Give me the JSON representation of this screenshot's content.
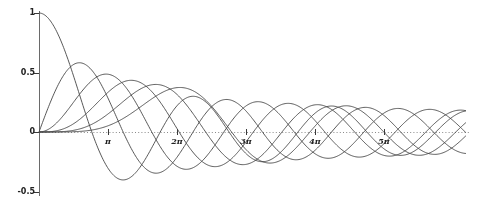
{
  "figure": {
    "background": "#ffffff"
  },
  "chart_data": {
    "type": "line",
    "title": "",
    "family": "Bessel functions of the first kind J_n(x), orders 0-5",
    "function_rule": "J_n(x) = (1/pi) * integral 0..pi of cos(n*t - x*sin(t)) dt",
    "grid": "off",
    "legend": "none",
    "x_axis": {
      "unit": "radians",
      "min_rad": 0,
      "max_rad": 19.45,
      "line_style": "dotted",
      "ticks": [
        {
          "label": "π",
          "pi_multiple": 1
        },
        {
          "label": "2π",
          "pi_multiple": 2
        },
        {
          "label": "3π",
          "pi_multiple": 3
        },
        {
          "label": "4π",
          "pi_multiple": 4
        },
        {
          "label": "5π",
          "pi_multiple": 5
        }
      ]
    },
    "y_axis": {
      "min": -0.55,
      "max": 1.08,
      "line_style": "solid",
      "ticks": [
        {
          "label": "1",
          "value": 1
        },
        {
          "label": "0.5",
          "value": 0.5
        },
        {
          "label": "0",
          "value": 0
        },
        {
          "label": "-0.5",
          "value": -0.5
        }
      ]
    },
    "series": [
      {
        "name": "J0(x)",
        "order": 0,
        "value_at_0": 1,
        "first_zero_rad": 2.405,
        "first_min": -0.403
      },
      {
        "name": "J1(x)",
        "order": 1,
        "value_at_0": 0,
        "max": 0.582,
        "max_at_rad": 1.84
      },
      {
        "name": "J2(x)",
        "order": 2,
        "value_at_0": 0,
        "max": 0.486,
        "max_at_rad": 3.05
      },
      {
        "name": "J3(x)",
        "order": 3,
        "value_at_0": 0,
        "max": 0.434,
        "max_at_rad": 4.2
      },
      {
        "name": "J4(x)",
        "order": 4,
        "value_at_0": 0,
        "max": 0.4,
        "max_at_rad": 5.32
      },
      {
        "name": "J5(x)",
        "order": 5,
        "value_at_0": 0,
        "max": 0.373,
        "max_at_rad": 6.42
      }
    ],
    "colors": {
      "curve": "#454545",
      "y_axis_line": "#6a6a6a",
      "tick_mark": "#3a3a3a",
      "dotted_axis": "#8a8a8a",
      "tick_label": "#222222"
    }
  }
}
